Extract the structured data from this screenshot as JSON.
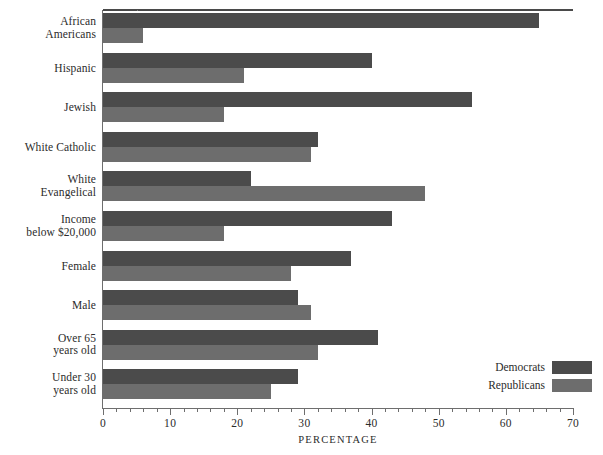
{
  "chart_data": {
    "type": "bar",
    "orientation": "horizontal",
    "title": "",
    "xlabel": "PERCENTAGE",
    "ylabel": "",
    "xlim": [
      0,
      70
    ],
    "xticks": [
      0,
      10,
      20,
      30,
      40,
      50,
      60,
      70
    ],
    "xtick_labels": [
      "0",
      "10",
      "20",
      "30",
      "40",
      "50",
      "60",
      "70"
    ],
    "minor_tick_step": 2,
    "grid": false,
    "legend_position": "bottom-right",
    "categories": [
      "African Americans",
      "Hispanic",
      "Jewish",
      "White Catholic",
      "White Evangelical",
      "Income below $20,000",
      "Female",
      "Male",
      "Over 65 years old",
      "Under 30 years old"
    ],
    "category_lines": [
      [
        "African",
        "Americans"
      ],
      [
        "Hispanic"
      ],
      [
        "Jewish"
      ],
      [
        "White Catholic"
      ],
      [
        "White",
        "Evangelical"
      ],
      [
        "Income",
        "below $20,000"
      ],
      [
        "Female"
      ],
      [
        "Male"
      ],
      [
        "Over 65",
        "years old"
      ],
      [
        "Under 30",
        "years old"
      ]
    ],
    "series": [
      {
        "name": "Democrats",
        "color": "#4b4b4b",
        "values": [
          65,
          40,
          55,
          32,
          22,
          43,
          37,
          29,
          41,
          29
        ]
      },
      {
        "name": "Republicans",
        "color": "#6d6d6d",
        "values": [
          6,
          21,
          18,
          31,
          48,
          18,
          28,
          31,
          32,
          25
        ]
      }
    ]
  },
  "axis": {
    "x_title": "PERCENTAGE"
  },
  "legend": {
    "entries": [
      {
        "label": "Democrats",
        "color": "#4b4b4b"
      },
      {
        "label": "Republicans",
        "color": "#6d6d6d"
      }
    ]
  }
}
